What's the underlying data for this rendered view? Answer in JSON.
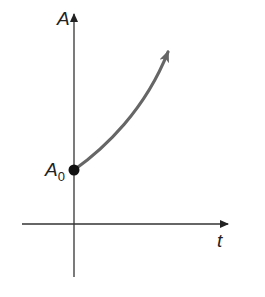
{
  "diagram": {
    "type": "exponential-growth-graph",
    "y_axis_label": "A",
    "x_axis_label": "t",
    "initial_point_label": "A",
    "initial_point_subscript": "0",
    "colors": {
      "axes": "#333333",
      "curve": "#666666",
      "point": "#111111"
    }
  }
}
